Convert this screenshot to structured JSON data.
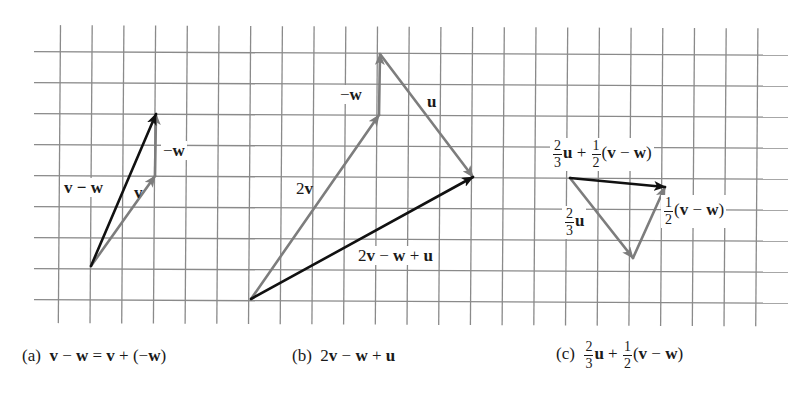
{
  "figure": {
    "grid": {
      "vertical_lines": 23,
      "horizontal_lines": 9,
      "cell_width_px": 31.7,
      "cell_height_px": 31,
      "color": "#8a8a8a"
    },
    "colors": {
      "result_vector": "#111111",
      "component_vector": "#7d7d7d",
      "grid": "#8a8a8a"
    },
    "panels": [
      {
        "id": "a",
        "caption": {
          "tag": "(a)",
          "expression": "v − w = v + (−w)",
          "parts": [
            "v",
            " − ",
            "w",
            " = ",
            "v",
            " + (−",
            "w",
            ")"
          ]
        },
        "vectors": [
          {
            "name": "v",
            "label": "v",
            "from": [
              91,
              266
            ],
            "to": [
              155,
              176
            ],
            "color": "component"
          },
          {
            "name": "-w",
            "label": "−w",
            "from": [
              155,
              176
            ],
            "to": [
              156,
              114
            ],
            "color": "component"
          },
          {
            "name": "v-w",
            "label": "v − w",
            "from": [
              91,
              266
            ],
            "to": [
              156,
              114
            ],
            "color": "result"
          }
        ],
        "labels": {
          "v_minus_w": {
            "minus": "v − ",
            "w": "w"
          },
          "v": "v",
          "neg_w": {
            "sign": "−",
            "w": "w"
          }
        }
      },
      {
        "id": "b",
        "caption": {
          "tag": "(b)",
          "expression": "2v − w + u"
        },
        "vectors": [
          {
            "name": "2v",
            "label": "2v",
            "from": [
              251,
              299
            ],
            "to": [
              379,
              115
            ],
            "color": "component"
          },
          {
            "name": "-w",
            "label": "−w",
            "from": [
              379,
              115
            ],
            "to": [
              380,
              54
            ],
            "color": "component"
          },
          {
            "name": "u",
            "label": "u",
            "from": [
              380,
              54
            ],
            "to": [
              473,
              177
            ],
            "color": "component"
          },
          {
            "name": "2v-w+u",
            "label": "2v − w + u",
            "from": [
              251,
              299
            ],
            "to": [
              473,
              177
            ],
            "color": "result"
          }
        ],
        "labels": {
          "two_v": {
            "coef": "2",
            "v": "v"
          },
          "neg_w": {
            "sign": "−",
            "w": "w"
          },
          "u": "u",
          "sum": {
            "coef": "2",
            "v": "v",
            "op1": " − ",
            "w": "w",
            "op2": " + ",
            "u": "u"
          }
        }
      },
      {
        "id": "c",
        "caption": {
          "tag": "(c)",
          "expression": "2/3 u + 1/2(v − w)"
        },
        "vectors": [
          {
            "name": "2/3u",
            "label": "2/3 u",
            "from": [
              570,
              178
            ],
            "to": [
              633,
              258
            ],
            "color": "component"
          },
          {
            "name": "1/2(v-w)",
            "label": "1/2(v − w)",
            "from": [
              633,
              258
            ],
            "to": [
              665,
              187
            ],
            "color": "component"
          },
          {
            "name": "2/3u+1/2(v-w)",
            "label": "2/3 u + 1/2(v − w)",
            "from": [
              570,
              178
            ],
            "to": [
              665,
              187
            ],
            "color": "result"
          }
        ],
        "labels": {
          "two_thirds": {
            "num": "2",
            "den": "3"
          },
          "one_half": {
            "num": "1",
            "den": "2"
          },
          "u": "u",
          "plus": " + ",
          "open": "(",
          "v": "v",
          "minus": " − ",
          "w": "w",
          "close": ")"
        }
      }
    ]
  }
}
